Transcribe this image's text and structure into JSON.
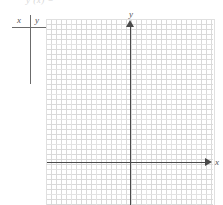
{
  "figure": {
    "type": "blank-coordinate-grid-with-value-table",
    "ghost_header_text": "y (x) =",
    "table": {
      "column_x_label": "x",
      "column_y_label": "y",
      "rows": []
    },
    "axes": {
      "x_label": "x",
      "y_label": "y",
      "x_arrow_direction": "right",
      "y_arrow_direction": "up"
    },
    "colors": {
      "axis": "#4a4a4a",
      "major_grid": "#e3e3e3",
      "minor_grid": "#d9d9d9",
      "rule": "#6b6b6b",
      "text": "#555555",
      "background": "#ffffff"
    }
  },
  "chart_data": {
    "type": "scatter",
    "title": "",
    "xlabel": "x",
    "ylabel": "y",
    "x": [],
    "y": [],
    "series": [],
    "grid": true,
    "minor_grid": true,
    "major_grid_spacing_cells": 5,
    "legend": "none",
    "note": "Empty graph paper; no data plotted. Origin at intersection of drawn axes."
  }
}
